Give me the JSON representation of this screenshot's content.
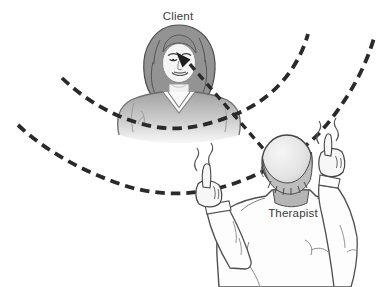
{
  "diagram": {
    "labels": {
      "client": "Client",
      "therapist": "Therapist"
    },
    "colors": {
      "background": "#ffffff",
      "dash_line": "#2a2a2a",
      "figure_outline": "#4a4a4a",
      "client_hair": "#939393",
      "client_sweater_top": "#a2a2a2",
      "client_sweater_bottom": "#f6f6f6",
      "skin": "#f5f5f5",
      "therapist_head": "#d9d9d9",
      "therapist_collar": "#b5b5b5",
      "shirt": "#fdfdfd",
      "label_text": "#3a3a3a"
    },
    "icons": {
      "gaze_arrow": "gaze-arrow-icon",
      "sweep_arc_outer": "dashed-arc-outer",
      "sweep_arc_inner": "dashed-arc-inner",
      "motion_squiggle": "motion-squiggle-icon"
    }
  }
}
